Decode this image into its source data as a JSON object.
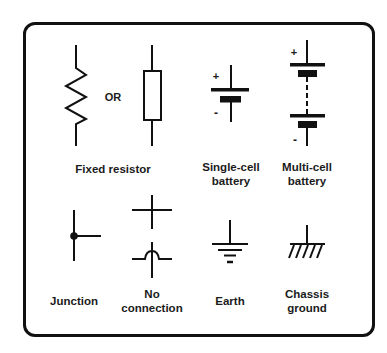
{
  "diagram": {
    "colors": {
      "stroke": "#111111",
      "text": "#1b1b1b",
      "background": "#ffffff"
    },
    "symbols": [
      {
        "id": "fixed-resistor",
        "label_lines": [
          "Fixed resistor"
        ],
        "variants": [
          "zigzag",
          "rectangle"
        ],
        "separator_text": "OR"
      },
      {
        "id": "single-cell-battery",
        "label_lines": [
          "Single-cell",
          "battery"
        ],
        "plus": "+",
        "minus": "-"
      },
      {
        "id": "multi-cell-battery",
        "label_lines": [
          "Multi-cell",
          "battery"
        ],
        "plus": "+",
        "minus": "-"
      },
      {
        "id": "junction",
        "label_lines": [
          "Junction"
        ]
      },
      {
        "id": "no-connection",
        "label_lines": [
          "No",
          "connection"
        ]
      },
      {
        "id": "earth",
        "label_lines": [
          "Earth"
        ]
      },
      {
        "id": "chassis-ground",
        "label_lines": [
          "Chassis",
          "ground"
        ]
      }
    ]
  }
}
